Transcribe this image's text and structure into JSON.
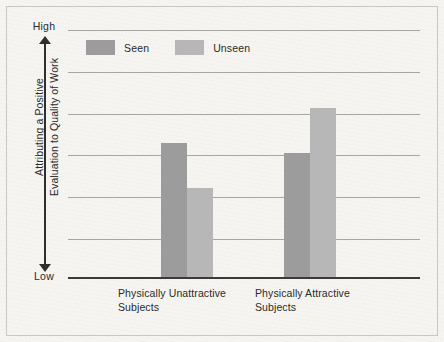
{
  "chart_data": {
    "type": "bar",
    "title": "",
    "subtitle": "",
    "xlabel": "",
    "ylabel": "Attributing a Positive Evaluation to Quality of Work",
    "ylabel_lines": [
      "Attributing a Positive",
      "Evaluation to Quality of Work"
    ],
    "categories": [
      "Physically Unattractive Subjects",
      "Physically Attractive Subjects"
    ],
    "category_lines": [
      [
        "Physically Unattractive",
        "Subjects"
      ],
      [
        "Physically Attractive",
        "Subjects"
      ]
    ],
    "series": [
      {
        "name": "Seen",
        "color": "#9c9c9c",
        "values": [
          3.26,
          3.02
        ]
      },
      {
        "name": "Unseen",
        "color": "#b7b7b7",
        "values": [
          2.17,
          4.1
        ]
      }
    ],
    "ylim": [
      0,
      6
    ],
    "y_axis_low_label": "Low",
    "y_axis_high_label": "High",
    "y_tick_labels": [],
    "gridlines": [
      1,
      2,
      3,
      4,
      5,
      6
    ],
    "grid": true,
    "grid_color": "#a8a6a0",
    "baseline_color": "#3a3a3a",
    "legend": {
      "position": "top-left-inside",
      "entries": [
        {
          "label": "Seen",
          "color": "#9c9c9c"
        },
        {
          "label": "Unseen",
          "color": "#b7b7b7"
        }
      ]
    },
    "background_color": "#f6f5f1",
    "border_color": "#c9c7c0",
    "text_color": "#2b2b2b"
  },
  "figure": {
    "axis_arrow_label_top": "High",
    "axis_arrow_label_bottom": "Low"
  }
}
